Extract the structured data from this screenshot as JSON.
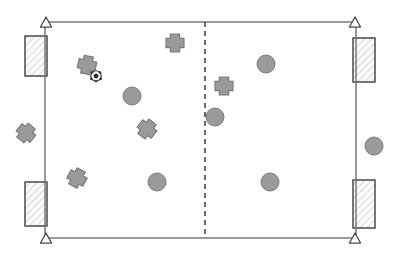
{
  "scene": {
    "title": "Soccer field tactical diagram",
    "width": 399,
    "height": 259,
    "background_color": "#ffffff"
  },
  "colors": {
    "line": "#6f6f6f",
    "line_dark": "#4a4a4a",
    "marker_fill": "#9a9a9a",
    "marker_stroke": "#7a7a7a",
    "goal_fill": "#fbfbfb",
    "goal_hatch": "#cfcfcf",
    "goal_stroke": "#4a4a4a",
    "ball_white": "#ffffff",
    "ball_black": "#2b2b2b"
  },
  "field": {
    "label": "playing-field",
    "x": 45,
    "y": 22,
    "width": 311,
    "height": 216,
    "stroke_width": 1.4
  },
  "halfway_line": {
    "label": "halfway-line",
    "x": 205,
    "y1": 22,
    "y2": 238,
    "dash": "5 4",
    "stroke_width": 1.6
  },
  "corner_flags": [
    {
      "name": "corner-flag-top-left",
      "x": 46,
      "y": 22,
      "size": 11
    },
    {
      "name": "corner-flag-top-right",
      "x": 355,
      "y": 22,
      "size": 11
    },
    {
      "name": "corner-flag-bottom-left",
      "x": 46,
      "y": 238,
      "size": 11
    },
    {
      "name": "corner-flag-bottom-right",
      "x": 355,
      "y": 238,
      "size": 11
    }
  ],
  "goals": [
    {
      "name": "goal-left-top",
      "x": 25,
      "y": 36,
      "width": 22,
      "height": 40
    },
    {
      "name": "goal-left-bottom",
      "x": 25,
      "y": 182,
      "width": 22,
      "height": 44
    },
    {
      "name": "goal-right-top",
      "x": 353,
      "y": 38,
      "width": 22,
      "height": 44
    },
    {
      "name": "goal-right-bottom",
      "x": 353,
      "y": 180,
      "width": 22,
      "height": 48
    }
  ],
  "team_circles": {
    "label": "team-circle-players",
    "radius": 9,
    "players": [
      {
        "name": "circle-player-1",
        "x": 132,
        "y": 96
      },
      {
        "name": "circle-player-2",
        "x": 266,
        "y": 64
      },
      {
        "name": "circle-player-3",
        "x": 215,
        "y": 117
      },
      {
        "name": "circle-player-4",
        "x": 157,
        "y": 182
      },
      {
        "name": "circle-player-5",
        "x": 270,
        "y": 182
      },
      {
        "name": "circle-player-6",
        "x": 374,
        "y": 146
      }
    ]
  },
  "team_crosses": {
    "label": "team-cross-players",
    "size": 18,
    "arm": 6,
    "players": [
      {
        "name": "cross-player-1",
        "x": 175,
        "y": 43,
        "rotation": 0
      },
      {
        "name": "cross-player-2",
        "x": 87,
        "y": 65,
        "rotation": 12
      },
      {
        "name": "cross-player-3",
        "x": 224,
        "y": 86,
        "rotation": 0
      },
      {
        "name": "cross-player-4",
        "x": 147,
        "y": 129,
        "rotation": 38
      },
      {
        "name": "cross-player-5",
        "x": 77,
        "y": 178,
        "rotation": 28
      },
      {
        "name": "cross-player-6",
        "x": 26,
        "y": 133,
        "rotation": 40
      }
    ]
  },
  "ball": {
    "name": "soccer-ball",
    "x": 96,
    "y": 76,
    "radius": 5.2
  }
}
